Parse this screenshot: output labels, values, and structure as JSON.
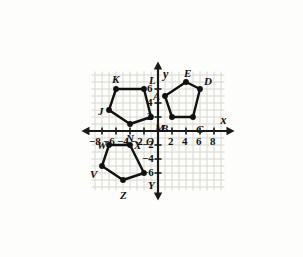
{
  "figure": {
    "type": "coordinate-plane-diagram",
    "title": "",
    "background": "#fdfdfb",
    "grid_color": "#d8d8d0",
    "axis_color": "#1a1a1a",
    "shape_color": "#111111",
    "unit_px": 7,
    "origin_px": {
      "x": 158,
      "y": 131
    },
    "x_range": [
      -9.5,
      9.5
    ],
    "y_range": [
      -8.5,
      8.5
    ]
  },
  "axes": {
    "x_axis_label": "x",
    "y_axis_label": "y",
    "origin_label": "O",
    "x_ticks": [
      {
        "value": -8,
        "label": "−8"
      },
      {
        "value": -6,
        "label": "−6"
      },
      {
        "value": -4,
        "label": "−4"
      },
      {
        "value": -2,
        "label": "−2"
      },
      {
        "value": 2,
        "label": "2"
      },
      {
        "value": 4,
        "label": "4"
      },
      {
        "value": 6,
        "label": "6"
      },
      {
        "value": 8,
        "label": "8"
      }
    ],
    "y_ticks": [
      {
        "value": 6,
        "label": "6"
      },
      {
        "value": 4,
        "label": "4"
      },
      {
        "value": 2,
        "label": "2"
      },
      {
        "value": -2,
        "label": "−2"
      },
      {
        "value": -4,
        "label": "−4"
      },
      {
        "value": -6,
        "label": "−6"
      }
    ]
  },
  "shapes": [
    {
      "name": "pentagon-jklmn",
      "label": "JKLMN",
      "quadrant": "upper-left",
      "vertices": [
        {
          "label": "J",
          "x": -7,
          "y": 3,
          "label_dx": -11,
          "label_dy": -4
        },
        {
          "label": "K",
          "x": -6,
          "y": 6,
          "label_dx": -4,
          "label_dy": -15
        },
        {
          "label": "L",
          "x": -2,
          "y": 6,
          "label_dx": 5,
          "label_dy": -14
        },
        {
          "label": "M",
          "x": -1,
          "y": 2,
          "label_dx": 4,
          "label_dy": 6
        },
        {
          "label": "N",
          "x": -4,
          "y": 1,
          "label_dx": -4,
          "label_dy": 9
        }
      ]
    },
    {
      "name": "pentagon-abcde",
      "label": "ABCDE",
      "quadrant": "upper-right",
      "vertices": [
        {
          "label": "A",
          "x": 1,
          "y": 5,
          "label_dx": -12,
          "label_dy": -5
        },
        {
          "label": "B",
          "x": 2,
          "y": 2,
          "label_dx": -11,
          "label_dy": 6
        },
        {
          "label": "C",
          "x": 5,
          "y": 2,
          "label_dx": 3,
          "label_dy": 7
        },
        {
          "label": "D",
          "x": 6,
          "y": 6,
          "label_dx": 4,
          "label_dy": -13
        },
        {
          "label": "E",
          "x": 4,
          "y": 7,
          "label_dx": -2,
          "label_dy": -14
        }
      ]
    },
    {
      "name": "pentagon-vwxyz",
      "label": "VWXYZ",
      "quadrant": "lower-left",
      "vertices": [
        {
          "label": "V",
          "x": -8,
          "y": -5,
          "label_dx": -12,
          "label_dy": 3
        },
        {
          "label": "W",
          "x": -7,
          "y": -2,
          "label_dx": -12,
          "label_dy": -5
        },
        {
          "label": "X",
          "x": -4,
          "y": -2,
          "label_dx": 4,
          "label_dy": -5
        },
        {
          "label": "Y",
          "x": -2,
          "y": -6,
          "label_dx": 4,
          "label_dy": 7
        },
        {
          "label": "Z",
          "x": -5,
          "y": -7,
          "label_dx": -3,
          "label_dy": 10
        }
      ]
    }
  ]
}
